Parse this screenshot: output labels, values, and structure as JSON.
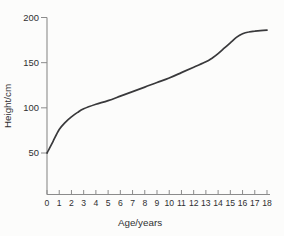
{
  "figure": {
    "background": "#fcfcfb",
    "axis_color": "#8b8b8b",
    "curve_color": "#39393b",
    "text_color": "#2f2f31"
  },
  "chart_data": {
    "type": "line",
    "title": "",
    "xlabel": "Age/years",
    "ylabel": "Height/cm",
    "xlim": [
      0,
      18
    ],
    "ylim": [
      50,
      200
    ],
    "x_ticks": [
      "0",
      "1",
      "2",
      "3",
      "4",
      "5",
      "6",
      "7",
      "8",
      "9",
      "10",
      "11",
      "12",
      "13",
      "14",
      "15",
      "16",
      "17",
      "18"
    ],
    "y_ticks": [
      "50",
      "100",
      "150",
      "200"
    ],
    "grid": false,
    "legend": null,
    "series": [
      {
        "name": "height-growth-curve",
        "x": [
          0,
          0.5,
          1,
          1.5,
          2,
          2.5,
          3,
          4,
          5,
          6,
          7,
          8,
          9,
          10,
          11,
          12,
          13,
          13.5,
          14,
          14.5,
          15,
          15.5,
          16,
          16.5,
          17,
          18
        ],
        "y": [
          50,
          63,
          76,
          84,
          90,
          95,
          99,
          104,
          108,
          113,
          118,
          123,
          128,
          133,
          139,
          145,
          151,
          155,
          160,
          166,
          172,
          178,
          182,
          184,
          185,
          186
        ]
      }
    ]
  }
}
